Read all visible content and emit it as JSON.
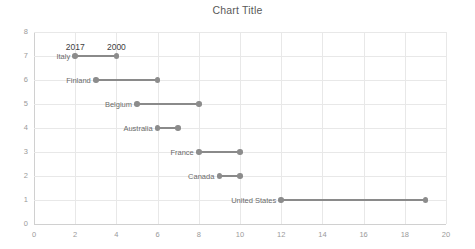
{
  "chart_data": {
    "type": "scatter",
    "subtype": "dumbbell",
    "title": "Chart Title",
    "xlabel": "",
    "ylabel": "",
    "xlim": [
      0,
      20
    ],
    "ylim": [
      0,
      8
    ],
    "x_ticks": [
      "0",
      "2",
      "4",
      "6",
      "8",
      "10",
      "12",
      "14",
      "16",
      "18",
      "20"
    ],
    "y_ticks": [
      "0",
      "1",
      "2",
      "3",
      "4",
      "5",
      "6",
      "7",
      "8"
    ],
    "grid": "both",
    "legend": "none",
    "annotations": [
      {
        "text": "2017",
        "x": 2,
        "y": 7
      },
      {
        "text": "2000",
        "x": 4,
        "y": 7
      }
    ],
    "series": [
      {
        "name": "2017",
        "color": "#8c8c8c"
      },
      {
        "name": "2000",
        "color": "#8c8c8c"
      }
    ],
    "categories": [
      "Italy",
      "Finland",
      "Belgium",
      "Australia",
      "France",
      "Canada",
      "United States"
    ],
    "rows": [
      {
        "label": "Italy",
        "y": 7,
        "start": 2,
        "end": 4
      },
      {
        "label": "Finland",
        "y": 6,
        "start": 3,
        "end": 6
      },
      {
        "label": "Belgium",
        "y": 5,
        "start": 5,
        "end": 8
      },
      {
        "label": "Australia",
        "y": 4,
        "start": 6,
        "end": 7
      },
      {
        "label": "France",
        "y": 3,
        "start": 8,
        "end": 10
      },
      {
        "label": "Canada",
        "y": 2,
        "start": 9,
        "end": 10
      },
      {
        "label": "United States",
        "y": 1,
        "start": 12,
        "end": 19
      }
    ]
  },
  "colors": {
    "marker": "#8c8c8c",
    "connector": "#8a8a8a",
    "grid": "#e8e8e8",
    "axis": "#d0d0d0",
    "tick_text": "#9a9a9a",
    "label_text": "#6b6b6b",
    "title_text": "#595959"
  }
}
